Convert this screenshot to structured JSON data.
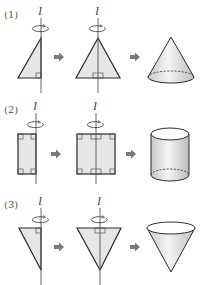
{
  "diagram": {
    "type": "solids-of-revolution",
    "axis_label": "l",
    "colors": {
      "stroke": "#2b2b2b",
      "fill": "#e6e6e6",
      "arrow": "#7a7a7a",
      "axis": "#555555"
    },
    "panels": [
      {
        "label": "(1)",
        "shape": "right triangle",
        "doubled_shape": "isosceles triangle",
        "result": "cone"
      },
      {
        "label": "(2)",
        "shape": "rectangle",
        "doubled_shape": "rectangle",
        "result": "cylinder"
      },
      {
        "label": "(3)",
        "shape": "right triangle (inverted)",
        "doubled_shape": "inverted isosceles triangle",
        "result": "inverted cone"
      }
    ]
  }
}
